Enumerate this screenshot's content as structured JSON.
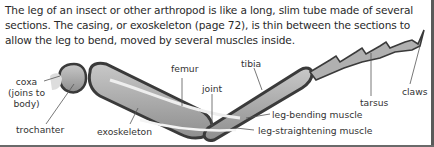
{
  "intro": {
    "lines": [
      "The leg of an insect or other arthropod is like a long, slim tube made of several",
      "sections. The casing, or exoskeleton (page 72), is thin between the sections to",
      "allow the leg to bend, moved by several muscles inside."
    ]
  },
  "labels": {
    "coxa": [
      "coxa",
      "(joins to",
      "body)"
    ],
    "trochanter": "trochanter",
    "exoskeleton": "exoskeleton",
    "femur": "femur",
    "joint": "joint",
    "tibia": "tibia",
    "leg_bending_muscle": "leg-bending muscle",
    "leg_straightening_muscle": "leg-straightening muscle",
    "tarsus": "tarsus",
    "claws": "claws"
  },
  "colors": {
    "outline": "#3a3a3a",
    "fill": "#a9a9a9",
    "muscle": "#e8e8e8"
  }
}
